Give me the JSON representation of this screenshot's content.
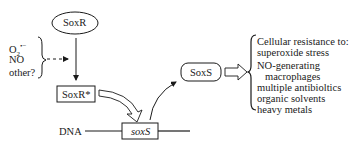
{
  "nodes": {
    "soxr": "SoxR",
    "soxr_active": "SoxR*",
    "soxs_protein": "SoxS",
    "soxs_gene": "soxS",
    "dna": "DNA"
  },
  "signals": [
    "O2⁻",
    "NO",
    "other?"
  ],
  "signal_o2_base": "O",
  "signal_o2_sub": "2",
  "signal_o2_sup": "•−",
  "resistance": {
    "title": "Cellular resistance to:",
    "items": [
      "superoxide stress",
      "NO-generating",
      "macrophages",
      "multiple antibioltics",
      "organic solvents",
      "heavy metals"
    ]
  }
}
